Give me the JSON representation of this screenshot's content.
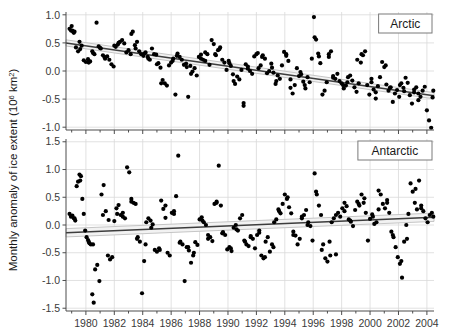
{
  "figure": {
    "ylabel_main": "Monthly anomaly of ice extent (10",
    "ylabel_sup": "6",
    "ylabel_tail": " km",
    "ylabel_sup2": "2",
    "ylabel_close": ")",
    "background_color": "#ffffff",
    "grid_color": "#d9d9d9",
    "point_color": "#000000",
    "trend_color": "#3d3d3d",
    "band_color": "#bfbfbf",
    "axis_color": "#4d4d4d"
  },
  "chart_data": [
    {
      "type": "scatter",
      "panel": "Arctic",
      "title": "Arctic",
      "xlabel": "",
      "ylabel": "Monthly anomaly of ice extent (10^6 km^2)",
      "xlim": [
        1978.6,
        2004.5
      ],
      "ylim": [
        -1.05,
        1.05
      ],
      "xticks": [
        1980,
        1982,
        1984,
        1986,
        1988,
        1990,
        1992,
        1994,
        1996,
        1998,
        2000,
        2002,
        2004
      ],
      "xticklabels": [
        "1980",
        "1982",
        "1984",
        "1986",
        "1988",
        "1990",
        "1992",
        "1994",
        "1996",
        "1998",
        "2000",
        "2002",
        "2004"
      ],
      "yticks": [
        1.0,
        0.5,
        0.0,
        -0.5,
        -1.0
      ],
      "yticklabels": [
        "1.0",
        "0.5",
        "0.0",
        "-0.5",
        "-1.0"
      ],
      "grid": true,
      "legend": "none",
      "trend": {
        "x0": 1978.6,
        "y0": 0.5,
        "x1": 2004.5,
        "y1": -0.44,
        "ci_halfwidth": 0.055
      },
      "x": [
        1978.85,
        1978.95,
        1979.0,
        1979.05,
        1979.1,
        1979.15,
        1979.3,
        1979.45,
        1979.55,
        1979.7,
        1979.85,
        1980.0,
        1980.15,
        1980.3,
        1980.45,
        1980.6,
        1980.75,
        1980.9,
        1981.05,
        1981.2,
        1981.35,
        1981.5,
        1981.65,
        1981.8,
        1981.95,
        1982.1,
        1982.25,
        1982.4,
        1982.55,
        1982.7,
        1982.85,
        1983.0,
        1983.15,
        1983.3,
        1983.45,
        1983.6,
        1983.75,
        1983.9,
        1984.05,
        1984.2,
        1984.35,
        1984.5,
        1984.65,
        1984.8,
        1984.95,
        1985.1,
        1985.25,
        1985.4,
        1985.55,
        1985.7,
        1985.85,
        1986.0,
        1986.15,
        1986.3,
        1986.45,
        1986.6,
        1986.75,
        1986.9,
        1987.05,
        1987.2,
        1987.35,
        1987.5,
        1987.65,
        1987.8,
        1987.95,
        1988.1,
        1988.25,
        1988.4,
        1988.55,
        1988.7,
        1988.85,
        1989.0,
        1989.15,
        1989.3,
        1989.45,
        1989.6,
        1989.75,
        1989.9,
        1990.05,
        1990.2,
        1990.35,
        1990.5,
        1990.65,
        1990.8,
        1990.95,
        1991.1,
        1991.25,
        1991.4,
        1991.55,
        1991.7,
        1991.85,
        1992.0,
        1992.15,
        1992.3,
        1992.45,
        1992.6,
        1992.75,
        1992.9,
        1993.05,
        1993.2,
        1993.35,
        1993.5,
        1993.65,
        1993.8,
        1993.95,
        1994.1,
        1994.25,
        1994.4,
        1994.55,
        1994.7,
        1994.85,
        1995.0,
        1995.15,
        1995.3,
        1995.45,
        1995.6,
        1995.75,
        1995.9,
        1996.05,
        1996.2,
        1996.35,
        1996.5,
        1996.65,
        1996.8,
        1996.95,
        1997.1,
        1997.25,
        1997.4,
        1997.55,
        1997.7,
        1997.85,
        1998.0,
        1998.15,
        1998.3,
        1998.45,
        1998.6,
        1998.75,
        1998.9,
        1999.05,
        1999.2,
        1999.35,
        1999.5,
        1999.65,
        1999.8,
        1999.95,
        2000.1,
        2000.25,
        2000.4,
        2000.55,
        2000.7,
        2000.85,
        2001.0,
        2001.15,
        2001.3,
        2001.45,
        2001.6,
        2001.75,
        2001.9,
        2002.05,
        2002.2,
        2002.35,
        2002.5,
        2002.65,
        2002.8,
        2002.95,
        2003.1,
        2003.25,
        2003.4,
        2003.55,
        2003.7,
        2003.85,
        2004.0,
        2004.15,
        2004.3,
        2004.4,
        2004.45,
        1979.2,
        1979.6,
        1980.2,
        1980.5,
        1981.0,
        1981.3,
        1982.0,
        1982.3,
        1983.2,
        1983.5,
        1984.1,
        1984.4,
        1985.0,
        1985.3,
        1986.1,
        1986.4,
        1987.1,
        1987.4,
        1988.1,
        1988.4,
        1989.1,
        1989.4,
        1990.1,
        1990.4,
        1991.1,
        1991.4,
        1992.1,
        1992.4,
        1993.1,
        1993.4,
        1994.1,
        1994.4,
        1995.1,
        1995.4,
        1996.1,
        1996.4,
        1997.1,
        1997.4,
        1998.1,
        1998.4,
        1999.1,
        1999.4,
        2000.1,
        2000.4,
        2001.1,
        2001.4,
        2002.1,
        2002.4,
        2003.1,
        2003.4
      ],
      "y": [
        0.75,
        0.72,
        0.8,
        0.72,
        0.7,
        0.68,
        0.42,
        0.35,
        0.52,
        0.45,
        0.19,
        0.16,
        0.21,
        0.17,
        0.35,
        0.3,
        0.86,
        0.44,
        0.4,
        0.28,
        0.22,
        0.26,
        0.2,
        0.12,
        0.08,
        0.43,
        0.47,
        0.52,
        0.55,
        0.49,
        0.33,
        0.37,
        0.3,
        0.7,
        0.46,
        0.52,
        0.35,
        0.3,
        0.27,
        0.33,
        0.25,
        0.2,
        0.4,
        0.3,
        0.29,
        0.14,
        0.06,
        -0.16,
        -0.22,
        -0.26,
        0.1,
        0.15,
        0.22,
        -0.42,
        0.31,
        0.25,
        0.2,
        0.11,
        0.13,
        -0.46,
        0.09,
        -0.01,
        0.05,
        -0.08,
        0.25,
        0.29,
        0.2,
        0.18,
        0.3,
        0.11,
        0.55,
        0.48,
        0.28,
        0.37,
        0.42,
        0.2,
        0.15,
        0.02,
        0.18,
        0.09,
        -0.06,
        -0.23,
        -0.1,
        -0.15,
        0.02,
        -0.57,
        0.12,
        0.04,
        0.0,
        -0.05,
        0.26,
        0.3,
        0.05,
        0.1,
        0.28,
        0.22,
        -0.04,
        0.0,
        0.13,
        -0.03,
        -0.23,
        -0.08,
        -0.14,
        0.1,
        0.34,
        0.27,
        0.18,
        -0.15,
        -0.4,
        -0.25,
        0.05,
        -0.09,
        -0.06,
        -0.19,
        -0.31,
        -0.11,
        -0.2,
        0.22,
        0.96,
        0.56,
        0.31,
        0.14,
        -0.42,
        -0.35,
        -0.2,
        0.25,
        0.35,
        -0.09,
        -0.14,
        -0.05,
        -0.18,
        -0.22,
        -0.31,
        -0.26,
        -0.11,
        -0.08,
        -0.17,
        -0.29,
        -0.37,
        -0.22,
        0.15,
        0.28,
        0.35,
        -0.25,
        -0.42,
        -0.14,
        -0.33,
        -0.49,
        -0.27,
        -0.11,
        0.16,
        0.07,
        -0.24,
        -0.35,
        -0.29,
        -0.55,
        -0.4,
        -0.34,
        -0.46,
        -0.22,
        -0.3,
        -0.12,
        -0.21,
        -0.43,
        -0.58,
        -0.38,
        -0.29,
        -0.52,
        -0.46,
        -0.35,
        -0.28,
        -0.7,
        -0.88,
        -1.01,
        -0.47,
        -0.35,
        0.7,
        0.39,
        0.15,
        0.32,
        0.41,
        0.25,
        0.45,
        0.5,
        0.66,
        0.4,
        0.31,
        0.22,
        0.12,
        -0.22,
        0.18,
        0.27,
        0.07,
        -0.05,
        0.22,
        0.33,
        0.3,
        0.39,
        0.14,
        -0.18,
        -0.62,
        0.08,
        0.32,
        0.25,
        0.06,
        -0.18,
        0.3,
        -0.3,
        -0.02,
        -0.25,
        0.6,
        0.26,
        0.3,
        -0.12,
        -0.25,
        -0.2,
        0.2,
        0.3,
        -0.2,
        -0.38,
        0.1,
        -0.3,
        -0.25,
        -0.36,
        -0.33,
        -0.4
      ]
    },
    {
      "type": "scatter",
      "panel": "Antarctic",
      "title": "Antarctic",
      "xlabel": "",
      "ylabel": "Monthly anomaly of ice extent (10^6 km^2)",
      "xlim": [
        1978.6,
        2004.5
      ],
      "ylim": [
        -1.55,
        1.55
      ],
      "xticks": [
        1980,
        1982,
        1984,
        1986,
        1988,
        1990,
        1992,
        1994,
        1996,
        1998,
        2000,
        2002,
        2004
      ],
      "xticklabels": [
        "1980",
        "1982",
        "1984",
        "1986",
        "1988",
        "1990",
        "1992",
        "1994",
        "1996",
        "1998",
        "2000",
        "2002",
        "2004"
      ],
      "yticks": [
        1.5,
        1.0,
        0.5,
        0.0,
        -0.5,
        -1.0,
        -1.5
      ],
      "yticklabels": [
        "1.5",
        "1.0",
        "0.5",
        "0.0",
        "-0.5",
        "-1.0",
        "-1.5"
      ],
      "grid": true,
      "legend": "none",
      "trend": {
        "x0": 1978.6,
        "y0": -0.14,
        "x1": 2004.5,
        "y1": 0.14,
        "ci_halfwidth": 0.075
      },
      "x": [
        1978.85,
        1978.95,
        1979.05,
        1979.15,
        1979.25,
        1979.35,
        1979.45,
        1979.55,
        1979.65,
        1979.75,
        1979.85,
        1979.95,
        1980.05,
        1980.15,
        1980.25,
        1980.35,
        1980.45,
        1980.55,
        1980.65,
        1980.8,
        1980.95,
        1981.1,
        1981.25,
        1981.4,
        1981.55,
        1981.7,
        1981.85,
        1982.0,
        1982.15,
        1982.3,
        1982.45,
        1982.6,
        1982.75,
        1982.9,
        1983.05,
        1983.2,
        1983.35,
        1983.5,
        1983.65,
        1983.8,
        1983.95,
        1984.1,
        1984.25,
        1984.4,
        1984.55,
        1984.7,
        1984.85,
        1985.0,
        1985.15,
        1985.3,
        1985.45,
        1985.6,
        1985.75,
        1985.9,
        1986.05,
        1986.2,
        1986.35,
        1986.5,
        1986.65,
        1986.8,
        1986.95,
        1987.1,
        1987.25,
        1987.4,
        1987.55,
        1987.7,
        1987.85,
        1988.0,
        1988.15,
        1988.3,
        1988.45,
        1988.6,
        1988.75,
        1988.9,
        1989.05,
        1989.2,
        1989.35,
        1989.5,
        1989.65,
        1989.8,
        1989.95,
        1990.1,
        1990.25,
        1990.4,
        1990.55,
        1990.7,
        1990.85,
        1991.0,
        1991.15,
        1991.3,
        1991.45,
        1991.6,
        1991.75,
        1991.9,
        1992.05,
        1992.2,
        1992.35,
        1992.5,
        1992.65,
        1992.8,
        1992.95,
        1993.1,
        1993.25,
        1993.4,
        1993.55,
        1993.7,
        1993.85,
        1994.0,
        1994.15,
        1994.3,
        1994.45,
        1994.6,
        1994.75,
        1994.9,
        1995.05,
        1995.2,
        1995.35,
        1995.5,
        1995.65,
        1995.8,
        1995.95,
        1996.1,
        1996.25,
        1996.4,
        1996.55,
        1996.7,
        1996.85,
        1997.0,
        1997.15,
        1997.3,
        1997.45,
        1997.6,
        1997.75,
        1997.9,
        1998.05,
        1998.2,
        1998.35,
        1998.5,
        1998.65,
        1998.8,
        1998.95,
        1999.1,
        1999.25,
        1999.4,
        1999.55,
        1999.7,
        1999.85,
        2000.0,
        2000.15,
        2000.3,
        2000.45,
        2000.6,
        2000.75,
        2000.9,
        2001.05,
        2001.2,
        2001.35,
        2001.5,
        2001.65,
        2001.8,
        2001.95,
        2002.1,
        2002.25,
        2002.4,
        2002.55,
        2002.7,
        2002.85,
        2003.0,
        2003.15,
        2003.3,
        2003.45,
        2003.6,
        2003.75,
        2003.9,
        2004.05,
        2004.2,
        2004.35,
        2004.45,
        1979.2,
        1979.6,
        1980.2,
        1980.5,
        1981.2,
        1981.6,
        1982.2,
        1982.6,
        1983.2,
        1983.6,
        1984.2,
        1984.6,
        1985.2,
        1985.6,
        1986.2,
        1986.6,
        1987.2,
        1987.6,
        1988.2,
        1988.6,
        1989.2,
        1989.6,
        1990.2,
        1990.6,
        1991.2,
        1991.6,
        1992.2,
        1992.6,
        1993.2,
        1993.6,
        1994.2,
        1994.6,
        1995.2,
        1995.6,
        1996.2,
        1996.6,
        1997.2,
        1997.6,
        1998.2,
        1998.6,
        1999.2,
        1999.6,
        2000.2,
        2000.6,
        2001.2,
        2001.6,
        2002.2,
        2002.6,
        2003.2,
        2003.6
      ],
      "y": [
        0.2,
        0.15,
        0.17,
        0.12,
        0.08,
        0.7,
        0.78,
        0.91,
        0.88,
        0.47,
        0.2,
        -0.1,
        -0.22,
        -0.27,
        -0.33,
        -0.35,
        -1.25,
        -1.4,
        -0.8,
        -0.72,
        -1.01,
        0.55,
        0.72,
        0.25,
        -0.55,
        -0.62,
        -0.58,
        0.07,
        0.3,
        0.36,
        0.18,
        0.22,
        0.12,
        1.04,
        0.95,
        0.47,
        0.4,
        0.38,
        -0.22,
        -0.3,
        -1.23,
        -0.65,
        0.05,
        0.12,
        0.08,
        0.01,
        -0.45,
        -0.48,
        -0.42,
        0.44,
        0.29,
        0.13,
        -0.5,
        -0.55,
        0.22,
        0.25,
        0.52,
        1.25,
        -0.3,
        -0.35,
        -1.01,
        -0.4,
        -0.46,
        -0.68,
        -0.55,
        -0.31,
        -0.36,
        0.1,
        0.14,
        0.05,
        0.0,
        -0.18,
        -0.22,
        -0.29,
        0.38,
        0.4,
        1.07,
        0.35,
        -0.13,
        -0.18,
        -0.44,
        -0.4,
        -0.47,
        -0.05,
        0.0,
        -0.1,
        0.12,
        0.18,
        -0.28,
        -0.35,
        -0.38,
        -0.2,
        -0.25,
        -0.42,
        -0.18,
        -0.1,
        -0.55,
        -0.6,
        -0.3,
        -0.22,
        -0.48,
        -0.35,
        0.05,
        0.1,
        0.28,
        0.21,
        0.38,
        0.55,
        0.47,
        0.32,
        0.21,
        -0.12,
        -0.19,
        -0.35,
        -0.25,
        0.12,
        0.18,
        0.27,
        0.05,
        -0.02,
        -0.28,
        0.93,
        0.55,
        0.35,
        0.18,
        -0.35,
        -0.6,
        -0.66,
        -0.3,
        0.05,
        0.12,
        -0.53,
        0.22,
        0.15,
        0.3,
        0.4,
        0.34,
        0.1,
        0.06,
        -0.02,
        0.27,
        0.42,
        0.35,
        0.55,
        0.4,
        0.22,
        -0.28,
        0.11,
        0.19,
        0.02,
        0.05,
        0.62,
        0.55,
        0.38,
        0.3,
        0.45,
        0.22,
        -0.12,
        -0.22,
        -0.4,
        -0.58,
        -0.7,
        -0.95,
        -0.3,
        0.0,
        0.2,
        0.75,
        0.6,
        0.4,
        0.28,
        0.8,
        0.35,
        0.25,
        0.12,
        0.05,
        0.18,
        0.22,
        0.15,
        0.12,
        0.8,
        -0.3,
        -0.35,
        0.18,
        0.09,
        0.2,
        0.15,
        0.42,
        -0.25,
        -0.35,
        -0.05,
        -0.45,
        0.35,
        0.2,
        -0.32,
        -0.4,
        -0.5,
        0.08,
        -0.25,
        0.42,
        -0.15,
        -0.42,
        -0.08,
        -0.3,
        -0.22,
        -0.14,
        -0.58,
        -0.4,
        0.25,
        0.5,
        -0.18,
        0.15,
        0.0,
        0.6,
        -0.45,
        -0.55,
        0.18,
        0.25,
        0.08,
        0.38,
        0.48,
        0.15,
        0.28,
        0.4,
        -0.18,
        -0.65,
        -0.25,
        0.65,
        0.3
      ]
    }
  ]
}
